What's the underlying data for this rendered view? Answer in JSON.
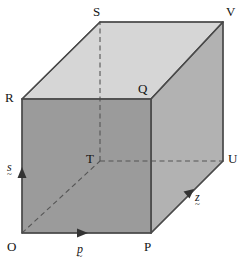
{
  "figure": {
    "type": "3d-cuboid-diagram",
    "colors": {
      "top_face": "#d6d6d6",
      "front_face": "#9b9b9b",
      "right_face": "#b2b2b2",
      "edge": "#4a4a4a",
      "hidden_edge": "#5a5a5a",
      "text": "#141414",
      "background": "#ffffff"
    },
    "vertices": [
      {
        "id": "O",
        "label": "O",
        "x": 22,
        "y": 233,
        "label_x": 8,
        "label_y": 240,
        "hidden": false
      },
      {
        "id": "P",
        "label": "P",
        "x": 151,
        "y": 233,
        "label_x": 145,
        "label_y": 240,
        "hidden": false
      },
      {
        "id": "R",
        "label": "R",
        "x": 22,
        "y": 99,
        "label_x": 6,
        "label_y": 92,
        "hidden": false
      },
      {
        "id": "Q",
        "label": "Q",
        "x": 151,
        "y": 99,
        "label_x": 139,
        "label_y": 83,
        "hidden": false
      },
      {
        "id": "T",
        "label": "T",
        "x": 100,
        "y": 161,
        "label_x": 87,
        "label_y": 153,
        "hidden": true
      },
      {
        "id": "U",
        "label": "U",
        "x": 223,
        "y": 161,
        "label_x": 228,
        "label_y": 153,
        "hidden": false
      },
      {
        "id": "S",
        "label": "S",
        "x": 100,
        "y": 22,
        "label_x": 93,
        "label_y": 5,
        "hidden": false
      },
      {
        "id": "V",
        "label": "V",
        "x": 223,
        "y": 22,
        "label_x": 226,
        "label_y": 5,
        "hidden": false
      }
    ],
    "axes": [
      {
        "id": "p",
        "label": "p",
        "undertilde": "~",
        "direction": "right",
        "label_x": 79,
        "label_y": 243
      },
      {
        "id": "s",
        "label": "s",
        "undertilde": "~",
        "direction": "up",
        "label_x": 8,
        "label_y": 162
      },
      {
        "id": "z",
        "label": "z",
        "undertilde": "~",
        "direction": "up-right",
        "label_x": 196,
        "label_y": 192
      }
    ],
    "edges_visible": [
      "O-P",
      "O-R",
      "R-Q",
      "Q-P",
      "R-S",
      "S-V",
      "V-Q",
      "V-U",
      "U-P"
    ],
    "edges_hidden": [
      "O-T",
      "T-S",
      "T-U"
    ]
  }
}
